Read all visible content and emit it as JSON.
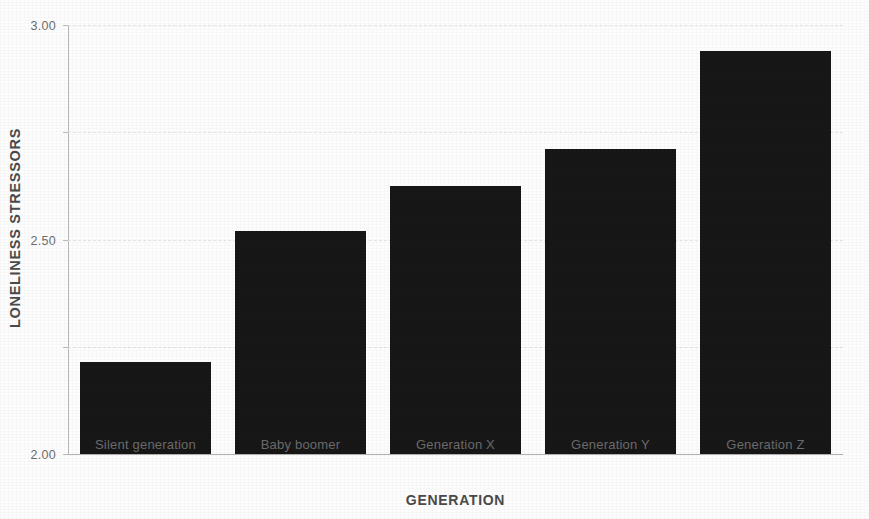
{
  "chart_data": {
    "type": "bar",
    "title": "",
    "subtitle": "",
    "xlabel": "GENERATION",
    "ylabel": "LONELINESS STRESSORS",
    "categories": [
      "Silent generation",
      "Baby boomer",
      "Generation X",
      "Generation Y",
      "Generation Z"
    ],
    "values": [
      1.43,
      2.04,
      2.25,
      2.42,
      2.88
    ],
    "ylim": [
      1.0,
      3.0
    ],
    "ytick_labels": [
      "1.00",
      "1.50",
      "2.00",
      "2.50",
      "3.00"
    ],
    "ytick_values": [
      1.0,
      1.5,
      2.0,
      2.5,
      3.0
    ],
    "grid": true,
    "grid_axis": "y",
    "grid_style": "dashed",
    "legend": false,
    "legend_position": "none",
    "bar_color": "#171717",
    "gridline_color": "#e3e3e3",
    "axis_line_color": "#b9b9b9",
    "tick_label_color": "#6d6d6d",
    "axis_title_color": "#4a4a4a",
    "background_color": "#fdfdfd"
  },
  "axes": {
    "y_title": "LONELINESS STRESSORS",
    "x_title": "GENERATION"
  }
}
